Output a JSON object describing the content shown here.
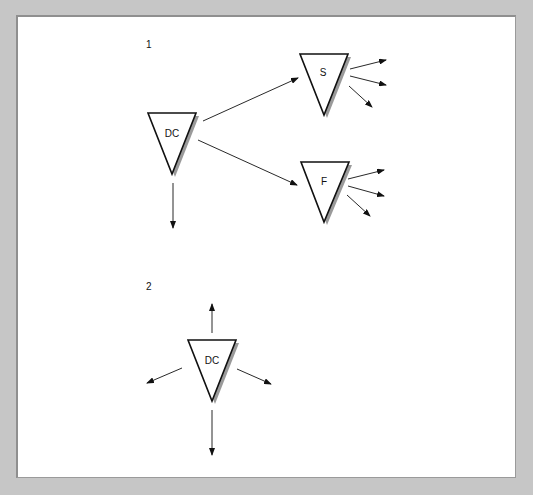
{
  "diagram": {
    "sections": [
      {
        "label": "1",
        "nodes": [
          {
            "id": "dc1",
            "label": "DC"
          },
          {
            "id": "s",
            "label": "S"
          },
          {
            "id": "f",
            "label": "F"
          }
        ],
        "edges": [
          {
            "from": "dc1",
            "to": "s"
          },
          {
            "from": "dc1",
            "to": "f"
          },
          {
            "from": "dc1",
            "to": "out-down"
          },
          {
            "from": "s",
            "to": "out-1"
          },
          {
            "from": "s",
            "to": "out-2"
          },
          {
            "from": "s",
            "to": "out-3"
          },
          {
            "from": "f",
            "to": "out-1"
          },
          {
            "from": "f",
            "to": "out-2"
          },
          {
            "from": "f",
            "to": "out-3"
          }
        ]
      },
      {
        "label": "2",
        "nodes": [
          {
            "id": "dc2",
            "label": "DC"
          }
        ],
        "edges": [
          {
            "from": "dc2",
            "to": "out-up"
          },
          {
            "from": "dc2",
            "to": "out-left"
          },
          {
            "from": "dc2",
            "to": "out-right"
          },
          {
            "from": "dc2",
            "to": "out-down"
          }
        ]
      }
    ]
  },
  "colors": {
    "background": "#c6c6c6",
    "panel": "#ffffff",
    "stroke": "#111111",
    "shadow": "#9a9a9a"
  }
}
